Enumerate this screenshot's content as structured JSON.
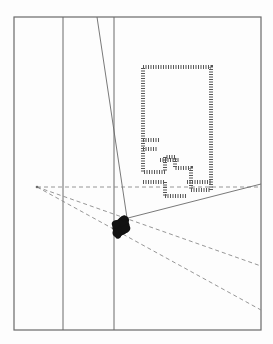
{
  "diagram": {
    "type": "line-drawing",
    "colors": {
      "background": "#fdfdfd",
      "stroke": "#6a6a6a",
      "dashed": "#8a8a8a",
      "blob": "#111111",
      "hatch": "#555555"
    },
    "frame": {
      "x": 14,
      "y": 17,
      "width": 247,
      "height": 313
    },
    "vertical_lines": [
      {
        "x": 63
      },
      {
        "x": 114
      }
    ],
    "diagonal_line": {
      "x1": 97,
      "y1": 17,
      "x2": 127,
      "y2": 218
    },
    "apex": {
      "x": 37,
      "y": 187
    },
    "dashed_rays": [
      {
        "x1": 37,
        "y1": 187,
        "x2": 261,
        "y2": 187
      },
      {
        "x1": 37,
        "y1": 187,
        "x2": 261,
        "y2": 266
      },
      {
        "x1": 37,
        "y1": 187,
        "x2": 261,
        "y2": 310
      }
    ],
    "solid_ray": {
      "x1": 128,
      "y1": 218,
      "x2": 261,
      "y2": 184
    },
    "blob": {
      "cx": 121,
      "cy": 227,
      "rx": 9,
      "ry": 8
    },
    "hatched_outline": {
      "points": "143,67 211,67 211,190 191,190 191,168 175,168 175,157 165,157 165,172 143,172 143,67",
      "inner_steps": [
        {
          "x1": 143,
          "y1": 140,
          "x2": 160,
          "y2": 140
        },
        {
          "x1": 143,
          "y1": 149,
          "x2": 158,
          "y2": 149
        },
        {
          "x1": 160,
          "y1": 160,
          "x2": 180,
          "y2": 160
        },
        {
          "x1": 143,
          "y1": 182,
          "x2": 165,
          "y2": 182
        },
        {
          "x1": 165,
          "y1": 182,
          "x2": 165,
          "y2": 196
        },
        {
          "x1": 165,
          "y1": 196,
          "x2": 187,
          "y2": 196
        },
        {
          "x1": 187,
          "y1": 182,
          "x2": 211,
          "y2": 182
        }
      ]
    }
  }
}
